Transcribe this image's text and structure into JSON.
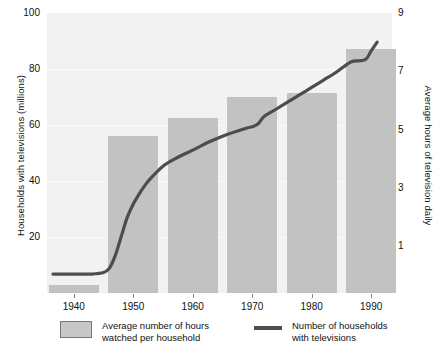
{
  "chart_data": {
    "type": "bar",
    "title": "",
    "subtitle": "",
    "xlabel": "",
    "ylabel": "Households with televisions (millions)",
    "y2label": "Average hours of television daily",
    "categories": [
      "1940",
      "1950",
      "1960",
      "1970",
      "1980",
      "1990"
    ],
    "x": [
      1940,
      1950,
      1960,
      1970,
      1980,
      1990
    ],
    "ylim": [
      0,
      100
    ],
    "y2lim": [
      -0.6,
      9.0
    ],
    "yticks": [
      "100",
      "80",
      "60",
      "40",
      "20"
    ],
    "ytick_values": [
      100,
      80,
      60,
      40,
      20
    ],
    "y2ticks": [
      "9",
      "7",
      "5",
      "3",
      "1"
    ],
    "y2tick_values": [
      9,
      7,
      5,
      3,
      1
    ],
    "grid": "horizontal-faint",
    "legend_position": "below",
    "series": [
      {
        "name": "Average number of hours watched per household",
        "type": "bar",
        "axis": "left",
        "color": "#c2c2c2",
        "values": [
          3,
          56,
          62.5,
          70,
          71.5,
          87
        ]
      },
      {
        "name": "Number of households with televisions",
        "type": "line",
        "axis": "right",
        "color": "#4d4d4d",
        "points": [
          [
            1936.5,
            0.05
          ],
          [
            1940,
            0.05
          ],
          [
            1943,
            0.05
          ],
          [
            1945,
            0.1
          ],
          [
            1946,
            0.25
          ],
          [
            1947,
            0.7
          ],
          [
            1948,
            1.35
          ],
          [
            1949,
            2.0
          ],
          [
            1950,
            2.45
          ],
          [
            1951,
            2.8
          ],
          [
            1952,
            3.1
          ],
          [
            1953,
            3.35
          ],
          [
            1955,
            3.75
          ],
          [
            1957,
            4.0
          ],
          [
            1959,
            4.2
          ],
          [
            1960,
            4.3
          ],
          [
            1963,
            4.6
          ],
          [
            1966,
            4.85
          ],
          [
            1969,
            5.05
          ],
          [
            1970,
            5.1
          ],
          [
            1971,
            5.2
          ],
          [
            1972,
            5.45
          ],
          [
            1974,
            5.7
          ],
          [
            1976,
            5.95
          ],
          [
            1978,
            6.2
          ],
          [
            1980,
            6.45
          ],
          [
            1982,
            6.7
          ],
          [
            1984,
            6.95
          ],
          [
            1986,
            7.25
          ],
          [
            1987,
            7.35
          ],
          [
            1989,
            7.4
          ],
          [
            1990,
            7.7
          ],
          [
            1991,
            8.0
          ]
        ]
      }
    ]
  },
  "legend": {
    "entries": [
      {
        "marker": "bar-swatch",
        "label": "Average number of hours\nwatched per household"
      },
      {
        "marker": "line-swatch",
        "label": "Number of households\nwith televisions"
      }
    ]
  },
  "colors": {
    "bar": "#c2c2c2",
    "line": "#4d4d4d",
    "plot_background": "#f2f2f2",
    "gridline": "#fbfbfb",
    "text": "#111111",
    "tick_mark": "#8a8a8a"
  }
}
